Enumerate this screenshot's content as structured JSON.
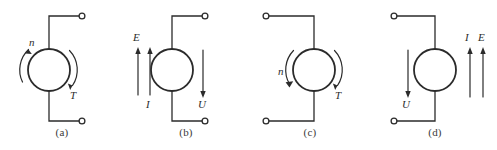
{
  "figure": {
    "title": "",
    "background_color": "#ffffff",
    "stroke_color": "#2b2b2b",
    "label_color": "#2b2b2b",
    "caption_color": "#3a3a3a",
    "panels": [
      {
        "id": "a",
        "caption": "(a)",
        "machine_symbol": "circle",
        "terminals_side": "right",
        "terminal_count": 2,
        "rotation_label": "n",
        "torque_label": "T",
        "rotation_arrow": "counterclockwise",
        "torque_arrow": "clockwise",
        "electrical_labels": []
      },
      {
        "id": "b",
        "caption": "(b)",
        "machine_symbol": "circle",
        "terminals_side": "right",
        "terminal_count": 2,
        "emf_label": "E",
        "current_label": "I",
        "voltage_label": "U",
        "emf_arrow": "up",
        "current_arrow": "up",
        "voltage_arrow": "down",
        "electrical_labels": [
          "E",
          "I",
          "U"
        ]
      },
      {
        "id": "c",
        "caption": "(c)",
        "machine_symbol": "circle",
        "terminals_side": "left",
        "terminal_count": 2,
        "rotation_label": "n",
        "torque_label": "T",
        "rotation_arrow": "clockwise",
        "torque_arrow": "clockwise",
        "electrical_labels": []
      },
      {
        "id": "d",
        "caption": "(d)",
        "machine_symbol": "circle",
        "terminals_side": "left",
        "terminal_count": 2,
        "emf_label": "E",
        "current_label": "I",
        "voltage_label": "U",
        "emf_arrow": "up",
        "current_arrow": "up",
        "voltage_arrow": "down",
        "electrical_labels": [
          "I",
          "E",
          "U"
        ]
      }
    ]
  }
}
